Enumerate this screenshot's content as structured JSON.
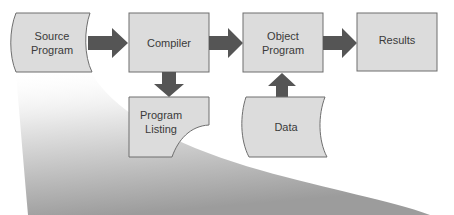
{
  "diagram": {
    "type": "flowchart",
    "nodes": [
      {
        "id": "source",
        "label": "Source\nProgram",
        "shape": "punched-tape"
      },
      {
        "id": "compiler",
        "label": "Compiler",
        "shape": "process"
      },
      {
        "id": "object",
        "label": "Object\nProgram",
        "shape": "process"
      },
      {
        "id": "results",
        "label": "Results",
        "shape": "process"
      },
      {
        "id": "listing",
        "label": "Program\nListing",
        "shape": "document"
      },
      {
        "id": "data",
        "label": "Data",
        "shape": "punched-tape"
      }
    ],
    "edges": [
      {
        "from": "source",
        "to": "compiler"
      },
      {
        "from": "compiler",
        "to": "object"
      },
      {
        "from": "object",
        "to": "results"
      },
      {
        "from": "compiler",
        "to": "listing"
      },
      {
        "from": "data",
        "to": "object"
      }
    ],
    "colors": {
      "box_fill": "#dcdcdc",
      "box_stroke": "#6e6e6e",
      "arrow": "#555555",
      "swoosh": "#9a9a9a"
    }
  }
}
